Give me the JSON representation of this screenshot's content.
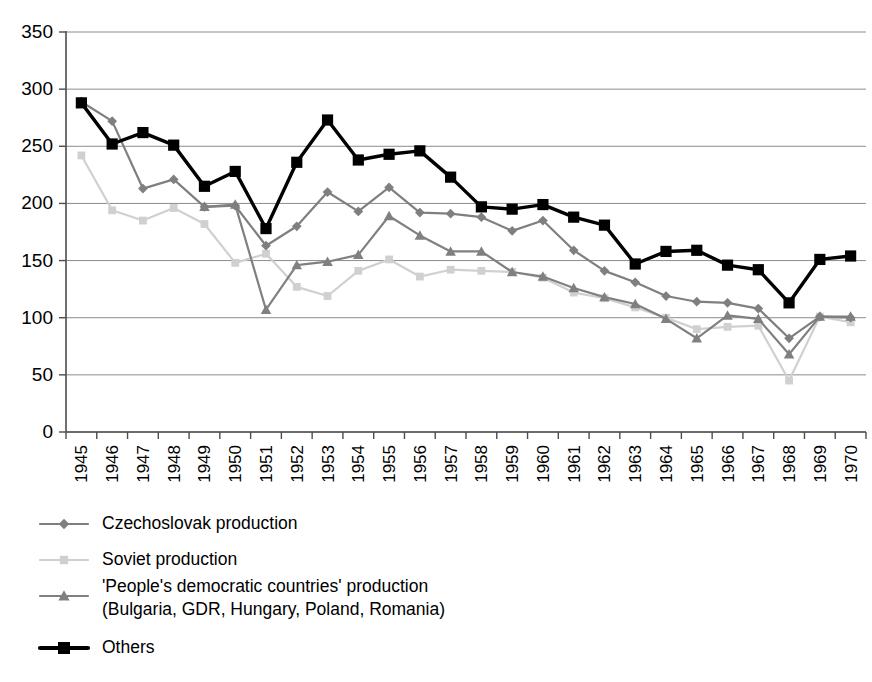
{
  "chart_data": {
    "type": "line",
    "title": "",
    "xlabel": "",
    "ylabel": "",
    "ylim": [
      0,
      350
    ],
    "ytick_values": [
      0,
      50,
      100,
      150,
      200,
      250,
      300,
      350
    ],
    "grid": true,
    "legend_position": "below-left",
    "categories": [
      "1945",
      "1946",
      "1947",
      "1948",
      "1949",
      "1950",
      "1951",
      "1952",
      "1953",
      "1954",
      "1955",
      "1956",
      "1957",
      "1958",
      "1959",
      "1960",
      "1961",
      "1962",
      "1963",
      "1964",
      "1965",
      "1966",
      "1967",
      "1968",
      "1969",
      "1970"
    ],
    "series": [
      {
        "name": "Czechoslovak production",
        "key": "czechoslovak",
        "color": "#7f7f7f",
        "marker": "diamond",
        "values": [
          289,
          272,
          213,
          221,
          197,
          198,
          163,
          180,
          210,
          193,
          214,
          192,
          191,
          188,
          176,
          185,
          159,
          141,
          131,
          119,
          114,
          113,
          108,
          82,
          101,
          100
        ]
      },
      {
        "name": "Soviet production",
        "key": "soviet",
        "color": "#d0d0d0",
        "marker": "square",
        "values": [
          242,
          194,
          185,
          196,
          182,
          148,
          156,
          127,
          119,
          141,
          151,
          136,
          142,
          141,
          140,
          135,
          122,
          117,
          109,
          100,
          90,
          92,
          93,
          45,
          101,
          96
        ]
      },
      {
        "name": "'People's democratic countries' production (Bulgaria, GDR, Hungary, Poland, Romania)",
        "key": "peoples",
        "label_line1": "'People's democratic countries' production",
        "label_line2": "(Bulgaria, GDR, Hungary, Poland, Romania)",
        "color": "#808080",
        "marker": "triangle",
        "values": [
          null,
          null,
          null,
          null,
          197,
          199,
          107,
          146,
          149,
          155,
          189,
          172,
          158,
          158,
          140,
          136,
          126,
          118,
          112,
          99,
          82,
          102,
          99,
          68,
          101,
          101
        ]
      },
      {
        "name": "Others",
        "key": "others",
        "color": "#000000",
        "marker": "square",
        "values": [
          288,
          252,
          262,
          251,
          215,
          228,
          178,
          236,
          273,
          238,
          243,
          246,
          223,
          197,
          195,
          199,
          188,
          181,
          147,
          158,
          159,
          146,
          142,
          113,
          151,
          154
        ]
      }
    ]
  },
  "legend": {
    "items": [
      {
        "label": "Czechoslovak production",
        "marker": "diamond-icon"
      },
      {
        "label": "Soviet production",
        "marker": "square-icon"
      },
      {
        "label": "'People's democratic countries' production",
        "label2": "(Bulgaria, GDR, Hungary, Poland, Romania)",
        "marker": "triangle-icon"
      },
      {
        "label": "Others",
        "marker": "square-icon"
      }
    ]
  }
}
